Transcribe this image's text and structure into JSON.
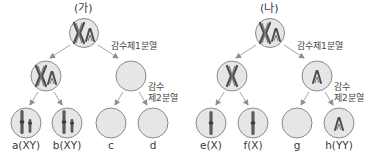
{
  "colors": {
    "cell_fill": "#e6e6e6",
    "cell_stroke": "#8a8a8a",
    "arrow": "#8f8f8f",
    "chromosome": "#6e6e6e",
    "chromosome_dark": "#4a4a4a",
    "text": "#3a3a3a"
  },
  "panels": [
    {
      "id": "ga",
      "title": "(가)",
      "meiosis1_label": "감수제1분열",
      "meiosis2_label_line1": "감수",
      "meiosis2_label_line2": "제2분열",
      "top_cell": {
        "chromosomes": [
          "X-dyad",
          "Y-dyad"
        ]
      },
      "mid_cells": [
        {
          "position": "left",
          "chromosomes": [
            "X-dyad",
            "Y-dyad"
          ]
        },
        {
          "position": "right",
          "chromosomes": []
        }
      ],
      "leaf_cells": [
        {
          "label": "a(XY)",
          "chromosomes": [
            "X",
            "Y"
          ]
        },
        {
          "label": "b(XY)",
          "chromosomes": [
            "X",
            "Y"
          ]
        },
        {
          "label": "c",
          "chromosomes": []
        },
        {
          "label": "d",
          "chromosomes": []
        }
      ]
    },
    {
      "id": "na",
      "title": "(나)",
      "meiosis1_label": "감수제1분열",
      "meiosis2_label_line1": "감수",
      "meiosis2_label_line2": "제2분열",
      "top_cell": {
        "chromosomes": [
          "X-dyad",
          "Y-dyad"
        ]
      },
      "mid_cells": [
        {
          "position": "left",
          "chromosomes": [
            "X-dyad"
          ]
        },
        {
          "position": "right",
          "chromosomes": [
            "Y-dyad"
          ]
        }
      ],
      "leaf_cells": [
        {
          "label": "e(X)",
          "chromosomes": [
            "X"
          ]
        },
        {
          "label": "f(X)",
          "chromosomes": [
            "X"
          ]
        },
        {
          "label": "g",
          "chromosomes": []
        },
        {
          "label": "h(YY)",
          "chromosomes": [
            "Y-dyad"
          ]
        }
      ]
    }
  ]
}
